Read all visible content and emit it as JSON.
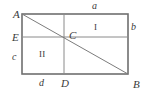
{
  "figure": {
    "kind": "geometry-diagram",
    "colors": {
      "background": "#ffffff",
      "outer_stroke": "#6f6f6f",
      "inner_stroke": "#8a8a8a",
      "diagonal_stroke": "#7c7c7c",
      "label_text": "#3a3a3a"
    },
    "geometry": {
      "rect": {
        "left": 22,
        "top": 14,
        "right": 128,
        "bottom": 74
      },
      "vertical_line_x": 64,
      "horizontal_line_y": 37,
      "diagonal": {
        "x1": 22,
        "y1": 14,
        "x2": 128,
        "y2": 74
      },
      "outer_stroke_width": 1.6,
      "inner_stroke_width": 1.0,
      "diagonal_stroke_width": 1.0
    },
    "vertices": [
      {
        "name": "A",
        "label": "A",
        "x": 13,
        "y": 9,
        "corner": "top-left"
      },
      {
        "name": "B",
        "label": "B",
        "x": 133,
        "y": 79,
        "corner": "bottom-right"
      },
      {
        "name": "C",
        "label": "C",
        "x": 69,
        "y": 30,
        "corner": "interior-intersection"
      },
      {
        "name": "D",
        "label": "D",
        "x": 61,
        "y": 78,
        "corner": "bottom-edge-foot"
      },
      {
        "name": "E",
        "label": "E",
        "x": 12,
        "y": 32,
        "corner": "left-edge-foot"
      }
    ],
    "side_labels": [
      {
        "name": "a",
        "label": "a",
        "x": 92,
        "y": 1,
        "edge": "top"
      },
      {
        "name": "b",
        "label": "b",
        "x": 131,
        "y": 22,
        "edge": "right-upper"
      },
      {
        "name": "c",
        "label": "c",
        "x": 12,
        "y": 52,
        "edge": "left-lower"
      },
      {
        "name": "d",
        "label": "d",
        "x": 39,
        "y": 78,
        "edge": "bottom-left"
      }
    ],
    "region_labels": [
      {
        "name": "I",
        "label": "I",
        "x": 94,
        "y": 23
      },
      {
        "name": "II",
        "label": "II",
        "x": 39,
        "y": 50
      }
    ]
  }
}
